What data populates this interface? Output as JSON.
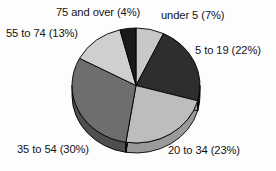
{
  "chart_data": {
    "type": "pie",
    "title": "",
    "subtitle": "",
    "xlabel": "",
    "ylabel": "",
    "legend_position": "none",
    "grid": false,
    "three_d": true,
    "labels_outside": true,
    "categories": [
      "under 5",
      "5 to 19",
      "20 to 34",
      "35 to 54",
      "55 to 74",
      "75 and over"
    ],
    "values": [
      7,
      22,
      23,
      30,
      13,
      4
    ],
    "value_unit": "%",
    "slices": [
      {
        "label": "under 5",
        "value": 7,
        "display": "under 5 (7%)",
        "color": "#c8c8c8",
        "side_color": "#a8a8a8"
      },
      {
        "label": "5 to 19",
        "value": 22,
        "display": "5 to 19 (22%)",
        "color": "#2e2e2e",
        "side_color": "#1d1d1d"
      },
      {
        "label": "20 to 34",
        "value": 23,
        "display": "20 to 34 (23%)",
        "color": "#bdbdbd",
        "side_color": "#9a9a9a"
      },
      {
        "label": "35 to 54",
        "value": 30,
        "display": "35 to 54 (30%)",
        "color": "#6e6e6e",
        "side_color": "#4e4e4e"
      },
      {
        "label": "55 to 74",
        "value": 13,
        "display": "55 to 74 (13%)",
        "color": "#cfcfcf",
        "side_color": "#aeaeae"
      },
      {
        "label": "75 and over",
        "value": 4,
        "display": "75 and over (4%)",
        "color": "#1a1a1a",
        "side_color": "#111111"
      }
    ],
    "start_angle_deg": 0,
    "direction": "clockwise",
    "outline_color": "#000000",
    "background_color": "#fdfdfd"
  },
  "labels": {
    "over75": "75 and over (4%)",
    "under5": "under 5 (7%)",
    "to74": "55 to 74 (13%)",
    "to19": "5 to 19 (22%)",
    "to54": "35 to 54 (30%)",
    "to34": "20 to 34 (23%)"
  }
}
